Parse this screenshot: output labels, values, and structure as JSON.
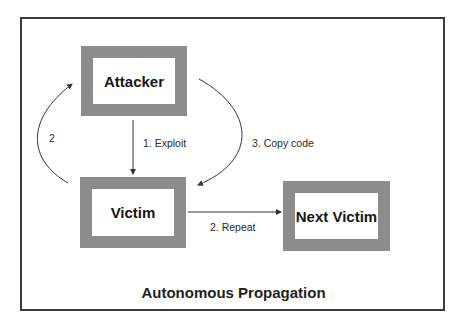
{
  "diagram": {
    "title": "Autonomous Propagation",
    "nodes": [
      {
        "id": "attacker",
        "label": "Attacker"
      },
      {
        "id": "victim",
        "label": "Victim"
      },
      {
        "id": "next_victim",
        "label": "Next Victim"
      }
    ],
    "edges": [
      {
        "from": "attacker",
        "to": "victim",
        "label": "1. Exploit"
      },
      {
        "from": "victim",
        "to": "next_victim",
        "label": "2. Repeat"
      },
      {
        "from": "victim",
        "to": "attacker",
        "label": "2"
      },
      {
        "from": "attacker",
        "to": "victim",
        "label": "3. Copy code"
      }
    ],
    "colors": {
      "node_border": "#8c8c8c",
      "frame": "#3a3a3a",
      "edge": "#333333"
    }
  }
}
